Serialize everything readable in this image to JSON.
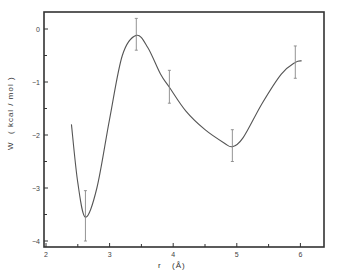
{
  "chart_data": {
    "type": "line",
    "title": "",
    "xlabel": "r (Å)",
    "ylabel": "W (kcal / mol)",
    "xlim": [
      2,
      6.35
    ],
    "ylim": [
      -4.1,
      0.3
    ],
    "grid": false,
    "legend": null,
    "x_ticks": [
      2,
      3,
      4,
      5,
      6
    ],
    "x_minor_ticks": [
      2.5,
      3.5,
      4.5,
      5.5
    ],
    "y_ticks": [
      0,
      -1,
      -2,
      -3,
      -4
    ],
    "y_minor_ticks": [
      -0.5,
      -1.5,
      -2.5,
      -3.5
    ],
    "series": [
      {
        "name": "W(r) smooth curve",
        "x": [
          2.4,
          2.5,
          2.62,
          2.8,
          3.0,
          3.2,
          3.42,
          3.6,
          3.8,
          3.94,
          4.2,
          4.5,
          4.8,
          4.93,
          5.1,
          5.4,
          5.7,
          5.92,
          6.02
        ],
        "y": [
          -1.8,
          -2.9,
          -3.55,
          -3.0,
          -1.7,
          -0.5,
          -0.12,
          -0.35,
          -0.85,
          -1.1,
          -1.55,
          -1.9,
          -2.15,
          -2.22,
          -2.05,
          -1.4,
          -0.85,
          -0.63,
          -0.6
        ]
      },
      {
        "name": "data points with error bars",
        "x": [
          2.62,
          3.42,
          3.94,
          4.93,
          5.92
        ],
        "y": [
          -3.55,
          -0.12,
          -1.1,
          -2.22,
          -0.63
        ],
        "err_low": [
          -4.0,
          -0.4,
          -1.4,
          -2.5,
          -0.93
        ],
        "err_high": [
          -3.05,
          0.2,
          -0.78,
          -1.9,
          -0.32
        ]
      }
    ]
  },
  "axes": {
    "x_label": "r",
    "x_unit": "(Å)",
    "y_label": "W",
    "y_unit": "( kcal / mol )",
    "x_tick_labels": [
      "2",
      "3",
      "4",
      "5",
      "6"
    ],
    "y_tick_labels": [
      "0",
      "−1",
      "−2",
      "−3",
      "−4"
    ]
  },
  "colors": {
    "axis": "#333333",
    "curve": "#555555",
    "errorbar": "#888888"
  }
}
